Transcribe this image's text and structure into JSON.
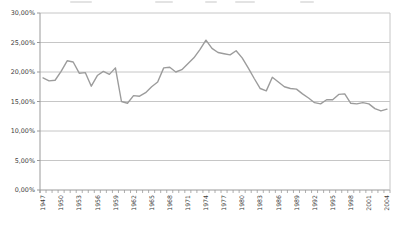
{
  "chart_data": {
    "type": "line",
    "title": "",
    "x": [
      1947,
      1948,
      1949,
      1950,
      1951,
      1952,
      1953,
      1954,
      1955,
      1956,
      1957,
      1958,
      1959,
      1960,
      1961,
      1962,
      1963,
      1964,
      1965,
      1966,
      1967,
      1968,
      1969,
      1970,
      1971,
      1972,
      1973,
      1974,
      1975,
      1976,
      1977,
      1978,
      1979,
      1980,
      1981,
      1982,
      1983,
      1984,
      1985,
      1986,
      1987,
      1988,
      1989,
      1990,
      1991,
      1992,
      1993,
      1994,
      1995,
      1996,
      1997,
      1998,
      1999,
      2000,
      2001,
      2002,
      2003,
      2004
    ],
    "values": [
      19.0,
      18.5,
      18.6,
      20.1,
      21.9,
      21.7,
      19.8,
      19.9,
      17.6,
      19.4,
      20.1,
      19.6,
      20.7,
      15.0,
      14.7,
      16.0,
      15.9,
      16.5,
      17.5,
      18.3,
      20.7,
      20.8,
      20.0,
      20.4,
      21.4,
      22.4,
      23.8,
      25.4,
      24.0,
      23.3,
      23.1,
      22.9,
      23.6,
      22.4,
      20.7,
      18.9,
      17.2,
      16.8,
      19.1,
      18.3,
      17.5,
      17.2,
      17.1,
      16.3,
      15.6,
      14.8,
      14.6,
      15.3,
      15.3,
      16.2,
      16.3,
      14.7,
      14.6,
      14.8,
      14.6,
      13.8,
      13.4,
      13.7
    ],
    "ylim": [
      0,
      30
    ],
    "ytick_values": [
      0,
      5,
      10,
      15,
      20,
      25,
      30
    ],
    "ytick_labels": [
      "0,00%",
      "5,00%",
      "10,00%",
      "15,00%",
      "20,00%",
      "25,00%",
      "30,00%"
    ],
    "xtick_label_step": 3,
    "xtick_labels_shown": [
      "1947",
      "1950",
      "1953",
      "1956",
      "1959",
      "1962",
      "1965",
      "1968",
      "1971",
      "1974",
      "1977",
      "1980",
      "1983",
      "1986",
      "1989",
      "1992",
      "1995",
      "1998",
      "2001",
      "2004"
    ],
    "grid": "horizontal",
    "legend": "none",
    "xlabel": "",
    "ylabel": "",
    "colors": {
      "line": "#9c9c9c",
      "grid": "#c6c6c6",
      "axis": "#9a9a9a",
      "tick": "#9a9a9a",
      "label_text": "#3c3c3c",
      "background": "#ffffff"
    }
  },
  "layout": {
    "plot_left": 40,
    "plot_right": 390,
    "plot_top": 13,
    "plot_bottom": 190
  }
}
